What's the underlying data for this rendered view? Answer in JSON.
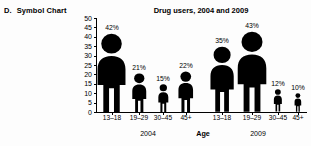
{
  "panel": {
    "letter": "D.",
    "label": "Symbol Chart"
  },
  "chart_data": {
    "type": "bar",
    "title": "Drug users, 2004 and 2009",
    "xlabel": "Age",
    "ylabel": "",
    "ylim": [
      0,
      50
    ],
    "yticks": [
      0,
      5,
      10,
      15,
      20,
      25,
      30,
      35,
      40,
      45,
      50
    ],
    "ytick_labels": [
      "0",
      "5",
      "10",
      "15",
      "20",
      "25",
      "30",
      "35",
      "40",
      "45",
      "50"
    ],
    "grid": false,
    "legend": "none",
    "categories": [
      "13–18",
      "19–29",
      "30–45",
      "45+"
    ],
    "groups": [
      "2004",
      "2009"
    ],
    "series": [
      {
        "name": "2004",
        "values": [
          42,
          21,
          15,
          22
        ],
        "data_labels": [
          "42%",
          "21%",
          "15%",
          "22%"
        ]
      },
      {
        "name": "2009",
        "values": [
          35,
          43,
          12,
          10
        ],
        "data_labels": [
          "35%",
          "43%",
          "12%",
          "10%"
        ]
      }
    ],
    "symbol": "person-pictogram",
    "symbol_color": "#000000"
  }
}
